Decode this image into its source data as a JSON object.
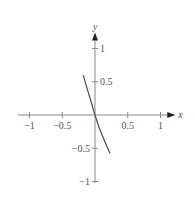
{
  "chart_data": {
    "type": "line",
    "title": "",
    "xlabel": "x",
    "ylabel": "y",
    "xlim": [
      -1.1,
      1.15
    ],
    "ylim": [
      -1.1,
      1.15
    ],
    "grid": false,
    "x_ticks": [
      -1,
      -0.5,
      0.5,
      1
    ],
    "x_tick_labels": [
      "−1",
      "−0.5",
      "0.5",
      "1"
    ],
    "y_ticks": [
      1,
      0.5,
      -0.5,
      -1
    ],
    "y_tick_labels": [
      "1",
      "0.5",
      "−0.5",
      "−1"
    ],
    "series": [
      {
        "name": "curve",
        "color": "#555555",
        "x": [
          -0.18,
          -0.12,
          -0.06,
          0,
          0.06,
          0.12,
          0.18,
          0.23
        ],
        "y": [
          0.6,
          0.4,
          0.2,
          0,
          -0.18,
          -0.33,
          -0.47,
          -0.58
        ]
      }
    ]
  }
}
